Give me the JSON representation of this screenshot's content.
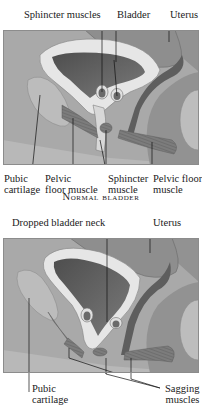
{
  "figure_normal": {
    "labels_top": {
      "sphincter_muscles": "Sphincter muscles",
      "bladder": "Bladder",
      "uterus": "Uterus"
    },
    "labels_bottom": {
      "pubic_cartilage": "Pubic\ncartilage",
      "pelvic_floor_muscle_left": "Pelvic\nfloor muscle",
      "sphincter_muscle": "Sphincter\nmuscle",
      "pelvic_floor_muscle_right": "Pelvic floor\nmuscle"
    },
    "caption": "Normal bladder"
  },
  "figure_dropped": {
    "labels_top": {
      "dropped_bladder_neck": "Dropped bladder neck",
      "uterus": "Uterus"
    },
    "labels_bottom": {
      "pubic_cartilage": "Pubic\ncartilage",
      "sagging_muscles": "Sagging\nmuscles"
    }
  },
  "colors": {
    "background_tissue": "#a9a9a9",
    "organ_light": "#c4c4c4",
    "bladder_wall": "#e6e6e6",
    "bladder_lumen": "#5e5e5e",
    "muscle": "#7a7a7a",
    "dark_tissue": "#6c6c6c",
    "frame_border": "#8c8c8c"
  }
}
